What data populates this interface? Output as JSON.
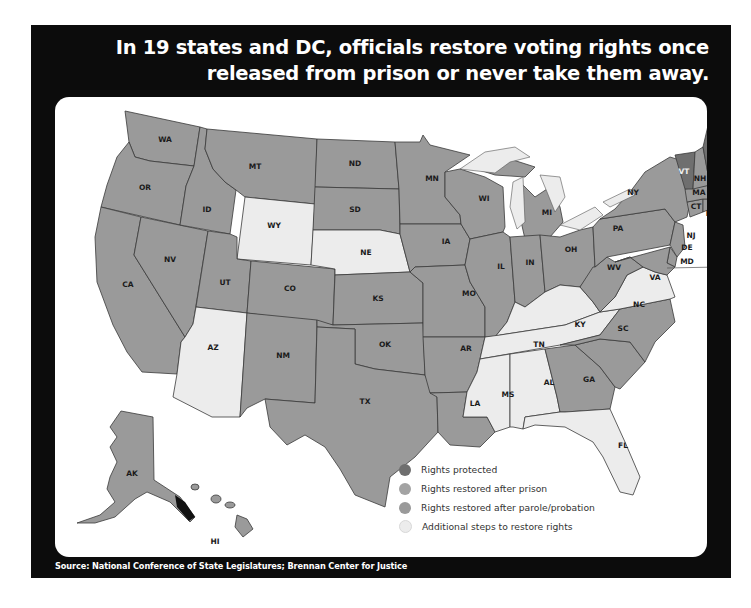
{
  "title": "In 19 states and DC, officials restore voting rights once released from prison or never take them away.",
  "title_lines": [
    "In 19 states and DC, officials restore voting rights once",
    "released from prison or never take them away."
  ],
  "source": "Source: National Conference of State Legislatures; Brennan Center for Justice",
  "colors": {
    "frame": "#0c0c0c",
    "card": "#ffffff",
    "rights_protected": "#6f6f6f",
    "restored_after_prison": "#9a9a9a",
    "restored_after_parole_probation": "#9d9d9d",
    "additional_steps": "#ececec",
    "lakes": "#ececec",
    "border": "#3a3a3a"
  },
  "legend": {
    "items": [
      {
        "key": "rights_protected",
        "label": "Rights protected",
        "color": "#6f6f6f"
      },
      {
        "key": "restored_after_prison",
        "label": "Rights restored after prison",
        "color": "#a3a3a3"
      },
      {
        "key": "restored_after_parole_probation",
        "label": "Rights restored after parole/probation",
        "color": "#9a9a9a"
      },
      {
        "key": "additional_steps",
        "label": "Additional steps to restore rights",
        "color": "#ececec"
      }
    ]
  },
  "map": {
    "states": {
      "WA": "WA",
      "OR": "OR",
      "CA": "CA",
      "NV": "NV",
      "ID": "ID",
      "MT": "MT",
      "WY": "WY",
      "UT": "UT",
      "AZ": "AZ",
      "CO": "CO",
      "NM": "NM",
      "ND": "ND",
      "SD": "SD",
      "NE": "NE",
      "KS": "KS",
      "OK": "OK",
      "TX": "TX",
      "MN": "MN",
      "IA": "IA",
      "MO": "MO",
      "AR": "AR",
      "LA": "LA",
      "WI": "WI",
      "IL": "IL",
      "MI": "MI",
      "IN": "IN",
      "OH": "OH",
      "KY": "KY",
      "TN": "TN",
      "MS": "MS",
      "AL": "AL",
      "GA": "GA",
      "FL": "FL",
      "SC": "SC",
      "NC": "NC",
      "VA": "VA",
      "WV": "WV",
      "PA": "PA",
      "NY": "NY",
      "NJ": "NJ",
      "DE": "DE",
      "MD": "MD",
      "DC": "DC",
      "CT": "CT",
      "RI": "RI",
      "MA": "MA",
      "VT": "VT",
      "NH": "NH",
      "ME": "ME",
      "AK": "AK",
      "HI": "HI"
    },
    "categories": {
      "rights_protected": [
        "ME",
        "VT",
        "DC"
      ],
      "additional_steps": [
        "WY",
        "NE",
        "AZ",
        "KY",
        "TN",
        "MS",
        "AL",
        "FL",
        "VA"
      ],
      "restored_other": [
        "WA",
        "OR",
        "CA",
        "NV",
        "ID",
        "MT",
        "UT",
        "CO",
        "NM",
        "ND",
        "SD",
        "KS",
        "OK",
        "TX",
        "MN",
        "IA",
        "MO",
        "AR",
        "LA",
        "WI",
        "IL",
        "MI",
        "IN",
        "OH",
        "GA",
        "SC",
        "NC",
        "WV",
        "PA",
        "NY",
        "NJ",
        "DE",
        "MD",
        "CT",
        "RI",
        "MA",
        "NH",
        "AK",
        "HI"
      ]
    }
  }
}
